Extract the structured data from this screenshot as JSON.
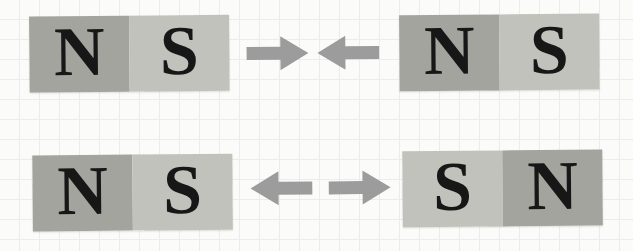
{
  "colors": {
    "north_pole_fill": "#a4a49f",
    "south_pole_fill": "#c2c2bc",
    "letter": "#171717",
    "arrow": "#9c9c9c",
    "paper": "#fbfbfa",
    "grid_line": "#ececee"
  },
  "rows": [
    {
      "magnets": [
        {
          "poles": [
            {
              "label": "N",
              "polarity": "north"
            },
            {
              "label": "S",
              "polarity": "south"
            }
          ]
        },
        {
          "poles": [
            {
              "label": "N",
              "polarity": "north"
            },
            {
              "label": "S",
              "polarity": "south"
            }
          ]
        }
      ],
      "arrows": [
        {
          "direction": "right"
        },
        {
          "direction": "left"
        }
      ]
    },
    {
      "magnets": [
        {
          "poles": [
            {
              "label": "N",
              "polarity": "north"
            },
            {
              "label": "S",
              "polarity": "south"
            }
          ]
        },
        {
          "poles": [
            {
              "label": "S",
              "polarity": "south"
            },
            {
              "label": "N",
              "polarity": "north"
            }
          ]
        }
      ],
      "arrows": [
        {
          "direction": "left"
        },
        {
          "direction": "right"
        }
      ]
    }
  ]
}
